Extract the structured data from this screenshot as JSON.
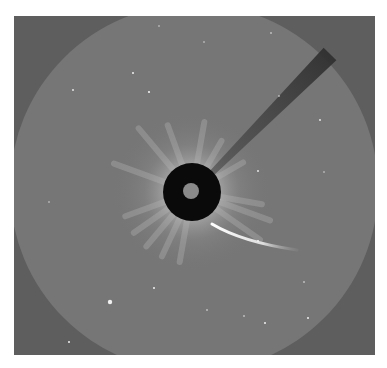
{
  "image": {
    "description": "Coronagraph view of the Sun with occulting disk, pylon shadow, comet tail and background stars",
    "frame": {
      "x": 14,
      "y": 16,
      "width": 361,
      "height": 339
    },
    "colors": {
      "page_background": "#ffffff",
      "corner_background": "#5e5e5e",
      "field_background": "#767676",
      "occulter": "#0a0a0a",
      "inner_disk": "#8a8a8a",
      "pylon": "#3a3a3a",
      "comet": "#f4f4f4",
      "star": "#f0f0f0"
    },
    "field_of_view": {
      "cx": 180,
      "cy": 172,
      "r": 184
    },
    "occulter": {
      "cx": 178,
      "cy": 176,
      "r": 29
    },
    "inner_disk": {
      "cx": 177,
      "cy": 175,
      "r": 8
    },
    "pylon": {
      "from": [
        197,
        158
      ],
      "to": [
        316,
        38
      ]
    },
    "comet": {
      "head": [
        198,
        208
      ],
      "tail_end": [
        283,
        234
      ]
    },
    "stars": [
      {
        "x": 96,
        "y": 286,
        "r": 2.2
      },
      {
        "x": 119,
        "y": 57,
        "r": 1
      },
      {
        "x": 135,
        "y": 76,
        "r": 1.1
      },
      {
        "x": 59,
        "y": 74,
        "r": 0.9
      },
      {
        "x": 244,
        "y": 225,
        "r": 1.1
      },
      {
        "x": 244,
        "y": 155,
        "r": 0.9
      },
      {
        "x": 140,
        "y": 272,
        "r": 1
      },
      {
        "x": 55,
        "y": 326,
        "r": 1
      },
      {
        "x": 251,
        "y": 307,
        "r": 1
      },
      {
        "x": 294,
        "y": 302,
        "r": 1
      },
      {
        "x": 230,
        "y": 300,
        "r": 0.8
      },
      {
        "x": 193,
        "y": 294,
        "r": 0.8
      },
      {
        "x": 306,
        "y": 104,
        "r": 0.9
      },
      {
        "x": 265,
        "y": 80,
        "r": 0.8
      },
      {
        "x": 257,
        "y": 17,
        "r": 0.8
      },
      {
        "x": 190,
        "y": 26,
        "r": 0.7
      },
      {
        "x": 145,
        "y": 10,
        "r": 0.7
      },
      {
        "x": 35,
        "y": 186,
        "r": 0.7
      },
      {
        "x": 290,
        "y": 266,
        "r": 0.8
      },
      {
        "x": 310,
        "y": 156,
        "r": 0.7
      },
      {
        "x": 108,
        "y": 340,
        "r": 0.8
      }
    ]
  }
}
